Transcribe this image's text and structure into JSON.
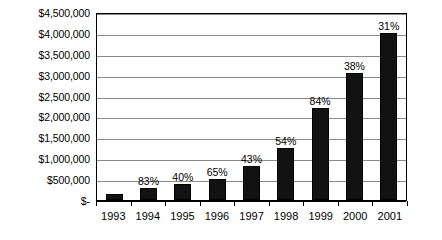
{
  "chart_data": {
    "type": "bar",
    "title": "",
    "subtitle": "",
    "xlabel": "",
    "ylabel": "",
    "categories": [
      "1993",
      "1994",
      "1995",
      "1996",
      "1997",
      "1998",
      "1999",
      "2000",
      "2001"
    ],
    "values": [
      150000,
      280000,
      390000,
      510000,
      810000,
      1250000,
      2200000,
      3050000,
      4000000
    ],
    "point_labels": [
      "",
      "83%",
      "40%",
      "65%",
      "43%",
      "54%",
      "84%",
      "38%",
      "31%"
    ],
    "ylim": [
      0,
      4500000
    ],
    "ytick_values": [
      0,
      500000,
      1000000,
      1500000,
      2000000,
      2500000,
      3000000,
      3500000,
      4000000,
      4500000
    ],
    "ytick_labels": [
      "$-",
      "$500,000",
      "$1,000,000",
      "$1,500,000",
      "$2,000,000",
      "$2,500,000",
      "$3,000,000",
      "$3,500,000",
      "$4,000,000",
      "$4,500,000"
    ],
    "grid": true,
    "legend": false,
    "legend_position": "none",
    "bar_color": "#121212",
    "grid_color": "#8a8a8a",
    "axis_color": "#000000",
    "background_color": "#ffffff"
  }
}
